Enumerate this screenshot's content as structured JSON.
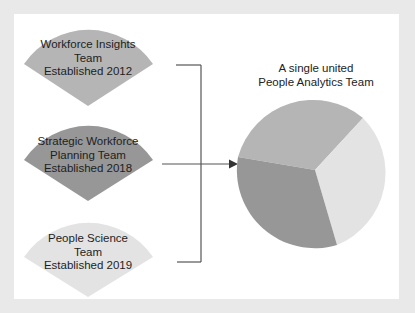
{
  "colors": {
    "background": "#e9e9e9",
    "panel": "#ffffff",
    "fan_workforce_insights": "#b5b5b5",
    "fan_strategic_workforce": "#979797",
    "fan_people_science": "#e3e3e3",
    "pie_top": "#b5b5b5",
    "pie_right": "#e3e3e3",
    "pie_left": "#979797",
    "connector": "#555555"
  },
  "source_teams": [
    {
      "line1": "Workforce Insights",
      "line2": "Team",
      "line3": "Established 2012"
    },
    {
      "line1": "Strategic Workforce",
      "line2": "Planning Team",
      "line3": "Established 2018"
    },
    {
      "line1": "People Science",
      "line2": "Team",
      "line3": "Established 2019"
    }
  ],
  "target": {
    "title_line1": "A single united",
    "title_line2": "People Analytics Team"
  },
  "connector": {
    "type": "bracket-merge-arrow",
    "arrow_icon": "arrow-right-icon"
  }
}
